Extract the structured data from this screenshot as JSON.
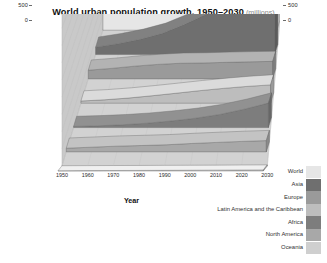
{
  "title": {
    "main": "World urban population growth, 1950–2030",
    "unit": "(millions)"
  },
  "axes": {
    "x_title": "Year",
    "x_ticks": [
      "1950",
      "1960",
      "1970",
      "1980",
      "1990",
      "2000",
      "2010",
      "2020",
      "2030"
    ],
    "y_ticks_left": [
      "5 000",
      "4 500",
      "4 000",
      "3 500",
      "3 000",
      "2 500",
      "2 000",
      "1 500",
      "1 000",
      "500",
      "0"
    ],
    "y_ticks_right": [
      "5 000",
      "4 500",
      "4 000",
      "3 500",
      "3 000",
      "2 500",
      "2 000",
      "1 500",
      "1 000",
      "500",
      "0"
    ]
  },
  "legend": {
    "items": [
      {
        "label": "World",
        "color": "#e6e6e6"
      },
      {
        "label": "Asia",
        "color": "#6f6f6f"
      },
      {
        "label": "Europe",
        "color": "#9a9a9a"
      },
      {
        "label": "Latin America and the Caribbean",
        "color": "#bdbdbd"
      },
      {
        "label": "Africa",
        "color": "#7d7d7d"
      },
      {
        "label": "North America",
        "color": "#a8a8a8"
      },
      {
        "label": "Oceania",
        "color": "#cfcfcf"
      }
    ]
  },
  "colors": {
    "background": "#ffffff",
    "back_wall": "#dcdcdc",
    "left_wall": "#c9c9c9",
    "floor": "#d2d2d2",
    "world_face": "#6d6d6d",
    "world_top": "#8c8c8c",
    "text": "#2b2b2b",
    "muted": "#8a8a8a"
  },
  "chart_data": {
    "type": "area",
    "xlabel": "Year",
    "ylabel": "",
    "unit": "millions",
    "grid": true,
    "legend_position": "right",
    "ylim": [
      0,
      5000
    ],
    "ytick_step": 500,
    "x": [
      1950,
      1960,
      1970,
      1980,
      1990,
      2000,
      2010,
      2020,
      2030
    ],
    "series": [
      {
        "name": "World",
        "values": [
          746,
          1019,
          1352,
          1754,
          2290,
          2857,
          3559,
          4338,
          5058
        ]
      },
      {
        "name": "Asia",
        "values": [
          245,
          359,
          506,
          706,
          1012,
          1361,
          1848,
          2361,
          2803
        ]
      },
      {
        "name": "Europe",
        "values": [
          281,
          339,
          411,
          468,
          505,
          515,
          535,
          552,
          566
        ]
      },
      {
        "name": "Latin America and the Caribbean",
        "values": [
          69,
          108,
          163,
          235,
          313,
          394,
          466,
          528,
          576
        ]
      },
      {
        "name": "Africa",
        "values": [
          33,
          53,
          85,
          133,
          200,
          285,
          400,
          560,
          748
        ]
      },
      {
        "name": "North America",
        "values": [
          110,
          140,
          171,
          190,
          212,
          250,
          282,
          312,
          336
        ]
      },
      {
        "name": "Oceania",
        "values": [
          8,
          11,
          14,
          16,
          19,
          22,
          25,
          29,
          32
        ]
      }
    ]
  }
}
